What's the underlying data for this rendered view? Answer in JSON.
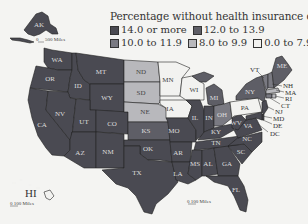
{
  "legend": {
    "title": "Percentage without health insurance coverage",
    "classes": [
      {
        "label": "14.0 or more",
        "color": "#4a4a52"
      },
      {
        "label": "12.0 to 13.9",
        "color": "#5e5e66"
      },
      {
        "label": "10.0 to 11.9",
        "color": "#7a7a82"
      },
      {
        "label": "8.0 to 9.9",
        "color": "#b8b8bc"
      },
      {
        "label": "0.0 to 7.9",
        "color": "#f2f2f0"
      }
    ]
  },
  "scales": {
    "alaska": "500 Miles",
    "alaska_zero": "0",
    "hawaii": "0 100 Miles",
    "mainland": "0 100 Miles"
  },
  "insets": {
    "alaska_label": "AK",
    "hawaii_label": "HI"
  },
  "states": {
    "WA": "WA",
    "OR": "OR",
    "CA": "CA",
    "ID": "ID",
    "NV": "NV",
    "MT": "MT",
    "WY": "WY",
    "UT": "UT",
    "AZ": "AZ",
    "CO": "CO",
    "NM": "NM",
    "ND": "ND",
    "SD": "SD",
    "NE": "NE",
    "KS": "KS",
    "OK": "OK",
    "TX": "TX",
    "MN": "MN",
    "IA": "IA",
    "MO": "MO",
    "AR": "AR",
    "LA": "LA",
    "WI": "WI",
    "IL": "IL",
    "MS": "MS",
    "MI": "MI",
    "IN": "IN",
    "KY": "KY",
    "TN": "TN",
    "AL": "AL",
    "OH": "OH",
    "WV": "WV",
    "VA": "VA",
    "NC": "NC",
    "SC": "SC",
    "GA": "GA",
    "FL": "FL",
    "PA": "PA",
    "NY": "NY",
    "ME": "ME"
  },
  "callouts": {
    "VT": "VT",
    "NH": "NH",
    "MA": "MA",
    "RI": "RI",
    "CT": "CT",
    "NJ": "NJ",
    "MD": "MD",
    "DE": "DE",
    "DC": "DC"
  },
  "state_classes": {
    "14.0 or more": [
      "AK",
      "WA",
      "OR",
      "CA",
      "ID",
      "NV",
      "MT",
      "WY",
      "UT",
      "AZ",
      "CO",
      "NM",
      "OK",
      "TX",
      "AR",
      "LA",
      "MS",
      "AL",
      "GA",
      "FL",
      "SC",
      "NC",
      "TN",
      "KY",
      "WV",
      "VA",
      "IN",
      "IL",
      "MO",
      "DC",
      "MD",
      "DE",
      "NJ"
    ],
    "12.0 to 13.9": [
      "KS",
      "MI",
      "NY",
      "ME"
    ],
    "10.0 to 11.9": [
      "OH",
      "VT",
      "NH",
      "CT"
    ],
    "8.0 to 9.9": [
      "ND",
      "SD",
      "NE",
      "MA",
      "RI"
    ],
    "0.0 to 7.9": [
      "MN",
      "WI",
      "IA",
      "PA",
      "HI"
    ]
  }
}
